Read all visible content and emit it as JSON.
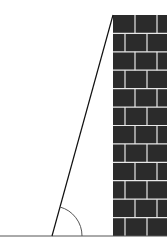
{
  "diagram": {
    "colors": {
      "background": "#ffffff",
      "brick": "#2b2b2b",
      "mortar": "#e8e8e8",
      "ground": "#555555",
      "ladder": "#111111",
      "angle_arc": "#555555"
    },
    "elements": {
      "ground": {
        "y": 236,
        "x1": 0,
        "x2": 167
      },
      "wall": {
        "x": 113,
        "top": 15,
        "bottom": 236,
        "brick_rows": 12
      },
      "ladder": {
        "foot_x": 52,
        "foot_y": 236,
        "top_x": 113,
        "top_y": 15
      },
      "angle": {
        "label": "",
        "radius": 30
      }
    }
  }
}
